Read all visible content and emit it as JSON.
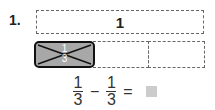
{
  "problem": {
    "number": "1.",
    "whole_label": "1",
    "shaded_piece": {
      "numerator": "1",
      "denominator": "3",
      "crossed_out": true
    },
    "pieces_count": 3,
    "equation": {
      "a_num": "1",
      "a_den": "3",
      "operator": "−",
      "b_num": "1",
      "b_den": "3",
      "equals": "=",
      "answer": ""
    }
  },
  "colors": {
    "shaded": "#a8a8a8",
    "answer_box": "#cccccc"
  }
}
